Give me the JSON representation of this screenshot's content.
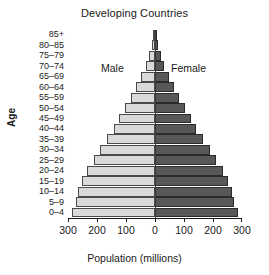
{
  "chart_data": {
    "type": "bar",
    "title": "Developing Countries",
    "xlabel": "Population (millions)",
    "ylabel": "Age",
    "orientation": "horizontal-pyramid",
    "grid": false,
    "legend_position": "inside-top-center",
    "xlim": [
      -300,
      300
    ],
    "xticks": [
      -300,
      -200,
      -100,
      0,
      100,
      200,
      300
    ],
    "xtick_labels": [
      "300",
      "200",
      "100",
      "0",
      "100",
      "200",
      "300"
    ],
    "categories": [
      "85+",
      "80–85",
      "75–79",
      "70–74",
      "65–69",
      "60–64",
      "55–59",
      "50–54",
      "45–49",
      "40–44",
      "35–39",
      "30–34",
      "25–29",
      "20–24",
      "15–19",
      "10–14",
      "5–9",
      "0–4"
    ],
    "series": [
      {
        "name": "Male",
        "side": "left",
        "color": "#d9d9d9",
        "values": [
          6,
          12,
          20,
          32,
          48,
          66,
          84,
          104,
          123,
          143,
          166,
          190,
          212,
          235,
          252,
          264,
          272,
          286
        ]
      },
      {
        "name": "Female",
        "side": "right",
        "color": "#585858",
        "values": [
          6,
          12,
          20,
          32,
          48,
          66,
          84,
          104,
          123,
          143,
          166,
          190,
          212,
          235,
          252,
          264,
          272,
          286
        ]
      }
    ],
    "annotations": [
      {
        "text": "Male",
        "position": "left-of-apex"
      },
      {
        "text": "Female",
        "position": "right-of-apex"
      }
    ]
  }
}
